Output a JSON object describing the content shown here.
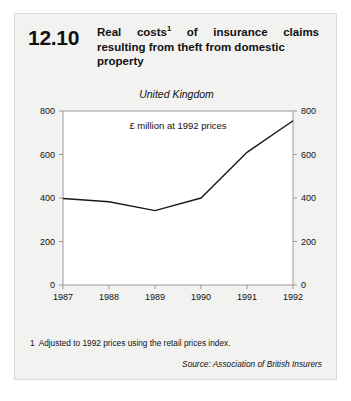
{
  "figure": {
    "number": "12.10",
    "title_lines": [
      "Real costs",
      " of insurance claims",
      "resulting from theft from domestic",
      "property"
    ],
    "title_footnote_marker": "1",
    "region_label": "United Kingdom",
    "units_label": "£ million at 1992 prices",
    "footnote_number": "1",
    "footnote_text": "Adjusted to 1992 prices using the retail prices index.",
    "source": "Source: Association of British Insurers"
  },
  "chart_data": {
    "type": "line",
    "subtitle": "United Kingdom",
    "xlabel": "",
    "ylabel": "£ million at 1992 prices",
    "x": [
      "1987",
      "1988",
      "1989",
      "1990",
      "1991",
      "1992"
    ],
    "categories": [
      "1987",
      "1988",
      "1989",
      "1990",
      "1991",
      "1992"
    ],
    "values": [
      398,
      383,
      342,
      400,
      610,
      755
    ],
    "series": [
      {
        "name": "Real costs of domestic theft insurance claims",
        "values": [
          398,
          383,
          342,
          400,
          610,
          755
        ]
      }
    ],
    "ylim": [
      0,
      800
    ],
    "ytick_labels": [
      "0",
      "200",
      "400",
      "600",
      "800"
    ],
    "ytick_values": [
      0,
      200,
      400,
      600,
      800
    ],
    "xtick_labels": [
      "1987",
      "1988",
      "1989",
      "1990",
      "1991",
      "1992"
    ],
    "grid": false,
    "legend": "none",
    "axis_right_mirrored": true,
    "line_color": "#1a1a1a",
    "plot_background": "#ffffff"
  },
  "colors": {
    "card_background": "#f2f2f1",
    "card_border": "#d9d9d7",
    "plot_frame": "#8c8c8c",
    "line": "#1a1a1a",
    "text": "#111111"
  }
}
